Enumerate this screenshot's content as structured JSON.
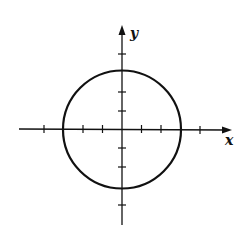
{
  "figure": {
    "x_axis_label": "x",
    "y_axis_label": "y",
    "circle": {
      "center": [
        0,
        0
      ],
      "radius": 3
    },
    "x_ticks": [
      -4,
      -3,
      -2,
      -1,
      1,
      2,
      3,
      4
    ],
    "y_ticks": [
      -4,
      -3,
      -2,
      -1,
      1,
      2,
      3,
      4
    ],
    "colors": {
      "stroke": "#111111",
      "background": "#ffffff"
    }
  }
}
